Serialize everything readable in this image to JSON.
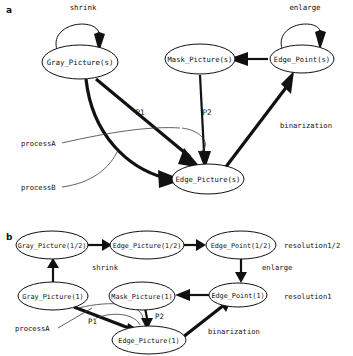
{
  "figure": {
    "background_color": "#ffffff",
    "ink_color": "#111111",
    "panels": [
      {
        "id": "a",
        "letter": "a"
      },
      {
        "id": "b",
        "letter": "b"
      }
    ]
  },
  "panel_a": {
    "letter": "a",
    "nodes": [
      {
        "id": "gray_s",
        "label": "Gray_Picture(s)",
        "cx": 80,
        "cy": 62,
        "rx": 38,
        "ry": 17
      },
      {
        "id": "mask_s",
        "label": "Mask_Picture(s)",
        "cx": 200,
        "cy": 59,
        "rx": 35,
        "ry": 15
      },
      {
        "id": "point_s",
        "label": "Edge_Point(s)",
        "cx": 302,
        "cy": 59,
        "rx": 32,
        "ry": 14
      },
      {
        "id": "edge_s",
        "label": "Edge_Picture(s)",
        "cx": 208,
        "cy": 179,
        "rx": 36,
        "ry": 15
      }
    ],
    "edge_labels": [
      {
        "id": "shrink_a",
        "text": "shrink",
        "x": 83,
        "y": 10
      },
      {
        "id": "enlarge_a",
        "text": "enlarge",
        "x": 305,
        "y": 10
      },
      {
        "id": "p1_a",
        "text": "P1",
        "x": 140,
        "y": 115
      },
      {
        "id": "p2_a",
        "text": "P2",
        "x": 207,
        "y": 115
      },
      {
        "id": "binarization_a",
        "text": "binarization",
        "x": 306,
        "y": 128
      },
      {
        "id": "processA_a",
        "text": "processA",
        "x": 21,
        "y": 146
      },
      {
        "id": "processB_a",
        "text": "processB",
        "x": 21,
        "y": 190
      }
    ]
  },
  "panel_b": {
    "letter": "b",
    "nodes": [
      {
        "id": "gray_half",
        "label": "Gray_Picture(1/2)",
        "cx": 52,
        "cy": 245,
        "rx": 36,
        "ry": 14
      },
      {
        "id": "edge_half",
        "label": "Edge_Picture(1/2)",
        "cx": 147,
        "cy": 245,
        "rx": 37,
        "ry": 14
      },
      {
        "id": "point_half",
        "label": "Edge_Point(1/2)",
        "cx": 241,
        "cy": 245,
        "rx": 35,
        "ry": 14
      },
      {
        "id": "gray_1",
        "label": "Gray_Picture(1)",
        "cx": 53,
        "cy": 296,
        "rx": 35,
        "ry": 14
      },
      {
        "id": "mask_1",
        "label": "Mask_Picture(1)",
        "cx": 142,
        "cy": 296,
        "rx": 33,
        "ry": 14
      },
      {
        "id": "point_1",
        "label": "Edge_Point(1)",
        "cx": 238,
        "cy": 295,
        "rx": 29,
        "ry": 12
      },
      {
        "id": "edge_1",
        "label": "Edge_Picture(1)",
        "cx": 149,
        "cy": 340,
        "rx": 37,
        "ry": 14
      }
    ],
    "edge_labels": [
      {
        "id": "shrink_b",
        "text": "shrink",
        "x": 92,
        "y": 270
      },
      {
        "id": "enlarge_b",
        "text": "enlarge",
        "x": 262,
        "y": 270
      },
      {
        "id": "p1_b",
        "text": "P1",
        "x": 88,
        "y": 324
      },
      {
        "id": "p2_b",
        "text": "P2",
        "x": 155,
        "y": 319
      },
      {
        "id": "binarization_b",
        "text": "binarization",
        "x": 208,
        "y": 334
      },
      {
        "id": "processA_b",
        "text": "processA",
        "x": 15,
        "y": 331
      }
    ],
    "row_labels": [
      {
        "id": "resolution_half",
        "text": "resolution1/2",
        "x": 284,
        "y": 245
      },
      {
        "id": "resolution_one",
        "text": "resolution1",
        "x": 284,
        "y": 296
      }
    ]
  }
}
